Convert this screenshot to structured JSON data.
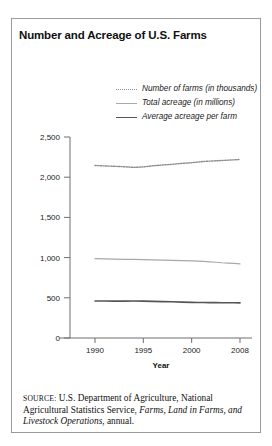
{
  "figure": {
    "title": "Number and Acreage of U.S. Farms",
    "axis_title_x": "Year",
    "source": {
      "label": "SOURCE:",
      "text_before": " U.S. Department of Agriculture, National Agricultural Statistics Service, ",
      "publication": "Farms, Land in Farms, and Livestock Operations",
      "text_after": ", annual."
    }
  },
  "legend": {
    "items": [
      {
        "label": "Number of farms (in thousands)",
        "style": "dotted",
        "color": "#8d8d8d"
      },
      {
        "label": "Total acreage (in millions)",
        "style": "solid-light",
        "color": "#a8a8a8"
      },
      {
        "label": "Average acreage per farm",
        "style": "solid-dark",
        "color": "#555555"
      }
    ]
  },
  "chart_data": {
    "type": "line",
    "title": "Number and Acreage of U.S. Farms",
    "xlabel": "Year",
    "ylabel": "",
    "ylim": [
      0,
      2500
    ],
    "yticks": [
      0,
      500,
      1000,
      1500,
      2000,
      2500
    ],
    "ytick_labels": [
      "0",
      "500",
      "1,000",
      "1,500",
      "2,000",
      "2,500"
    ],
    "xticks": [
      1990,
      1995,
      2000,
      2008
    ],
    "xtick_labels": [
      "1990",
      "1995",
      "2000",
      "2008"
    ],
    "grid": false,
    "legend_position": "top-right",
    "x": [
      1990,
      1991,
      1992,
      1993,
      1994,
      1995,
      1996,
      1997,
      1998,
      1999,
      2000,
      2001,
      2002,
      2003,
      2004,
      2005,
      2006,
      2007,
      2008
    ],
    "series": [
      {
        "name": "Number of farms (in thousands)",
        "style": "dotted",
        "color": "#8d8d8d",
        "values": [
          2146,
          2140,
          2136,
          2130,
          2122,
          2128,
          2142,
          2152,
          2160,
          2172,
          2180,
          2188,
          2196,
          2200,
          2204,
          2208,
          2212,
          2216,
          2220
        ]
      },
      {
        "name": "Total acreage (in millions)",
        "style": "solid-light",
        "color": "#a8a8a8",
        "values": [
          987,
          984,
          982,
          979,
          977,
          975,
          972,
          969,
          966,
          963,
          960,
          956,
          952,
          948,
          942,
          936,
          932,
          928,
          922
        ]
      },
      {
        "name": "Average acreage per farm",
        "style": "solid-dark",
        "color": "#555555",
        "values": [
          461,
          460,
          459,
          459,
          460,
          459,
          455,
          452,
          450,
          446,
          443,
          442,
          441,
          440,
          440,
          439,
          439,
          438,
          437
        ]
      }
    ]
  }
}
